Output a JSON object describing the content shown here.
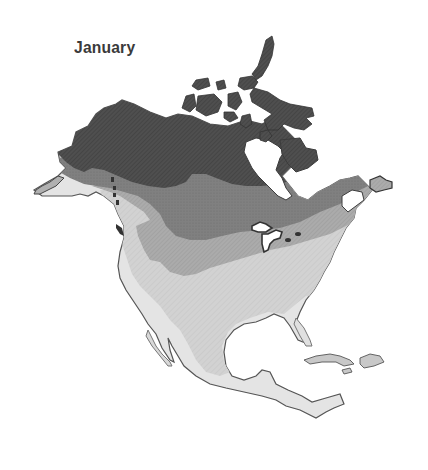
{
  "map": {
    "title": "January",
    "region": "North America",
    "style": "grayscale thematic shaded map, no legend shown",
    "zones": [
      {
        "id": "zone-1",
        "shade": "darkest",
        "color": "#4a4a4a",
        "pattern": "dense crosshatch",
        "area": "Alaska, northern Canada, Arctic archipelago, Baffin Island, northern Quebec"
      },
      {
        "id": "zone-2",
        "shade": "dark",
        "color": "#7c7c7c",
        "pattern": "stipple",
        "area": "central Canada, Labrador, southern Alaska coast"
      },
      {
        "id": "zone-3",
        "shade": "medium",
        "color": "#a6a6a6",
        "pattern": "fine crosshatch",
        "area": "southern Canada, northern United States, Great Lakes, Rocky Mountains"
      },
      {
        "id": "zone-4",
        "shade": "light",
        "color": "#cdcdcd",
        "pattern": "light crosshatch",
        "area": "central and southern United States, northern Mexico"
      },
      {
        "id": "zone-5",
        "shade": "lightest",
        "color": "#e6e6e6",
        "pattern": "near solid",
        "area": "Gulf coast, Florida, Baja California, southern Mexico, Central America, Caribbean"
      }
    ],
    "colors": {
      "background": "#ffffff",
      "outline": "#3c3c3c",
      "water": "#ffffff",
      "title": "#3a3a3a"
    }
  }
}
